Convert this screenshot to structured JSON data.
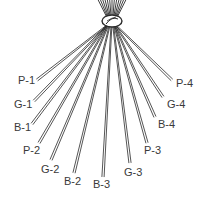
{
  "diagram": {
    "knot": {
      "x": 112,
      "y": 21
    },
    "color": "#2a2a2a",
    "strands": [
      {
        "label": "P-1",
        "end": [
          37,
          80
        ],
        "label_pos": [
          18,
          75
        ]
      },
      {
        "label": "G-1",
        "end": [
          34,
          101
        ],
        "label_pos": [
          14,
          99
        ]
      },
      {
        "label": "B-1",
        "end": [
          32,
          124
        ],
        "label_pos": [
          14,
          122
        ]
      },
      {
        "label": "P-2",
        "end": [
          39,
          143
        ],
        "label_pos": [
          23,
          145
        ]
      },
      {
        "label": "G-2",
        "end": [
          51,
          160
        ],
        "label_pos": [
          41,
          164
        ]
      },
      {
        "label": "B-2",
        "end": [
          74,
          173
        ],
        "label_pos": [
          64,
          176
        ]
      },
      {
        "label": "B-3",
        "end": [
          103,
          177
        ],
        "label_pos": [
          93,
          179
        ]
      },
      {
        "label": "G-3",
        "end": [
          130,
          163
        ],
        "label_pos": [
          124,
          167
        ]
      },
      {
        "label": "P-3",
        "end": [
          147,
          143
        ],
        "label_pos": [
          144,
          145
        ]
      },
      {
        "label": "B-4",
        "end": [
          155,
          117
        ],
        "label_pos": [
          158,
          119
        ]
      },
      {
        "label": "G-4",
        "end": [
          163,
          97
        ],
        "label_pos": [
          167,
          99
        ]
      },
      {
        "label": "P-4",
        "end": [
          172,
          80
        ],
        "label_pos": [
          176,
          78
        ]
      }
    ]
  }
}
